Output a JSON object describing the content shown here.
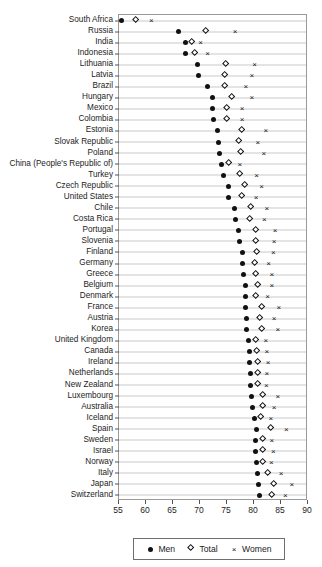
{
  "chart_data": {
    "type": "scatter",
    "title": "",
    "xlabel": "",
    "ylabel": "",
    "xlim": [
      55,
      90
    ],
    "xticks": [
      55,
      60,
      65,
      70,
      75,
      80,
      85,
      90
    ],
    "xticklabels": [
      "55",
      "60",
      "65",
      "70",
      "75",
      "80",
      "85",
      "90"
    ],
    "grid": "horizontal",
    "legend_position": "bottom",
    "series": [
      {
        "name": "Men",
        "marker": "filled-circle"
      },
      {
        "name": "Total",
        "marker": "open-diamond"
      },
      {
        "name": "Women",
        "marker": "cross"
      }
    ],
    "categories": [
      "South Africa",
      "Russia",
      "India",
      "Indonesia",
      "Lithuania",
      "Latvia",
      "Brazil",
      "Hungary",
      "Mexico",
      "Colombia",
      "Estonia",
      "Slovak Republic",
      "Poland",
      "China (People's Republic of)",
      "Turkey",
      "Czech Republic",
      "United States",
      "Chile",
      "Costa Rica",
      "Portugal",
      "Slovenia",
      "Finland",
      "Germany",
      "Greece",
      "Belgium",
      "Denmark",
      "France",
      "Austria",
      "Korea",
      "United Kingdom",
      "Canada",
      "Ireland",
      "Netherlands",
      "New Zealand",
      "Luxembourg",
      "Australia",
      "Iceland",
      "Spain",
      "Sweden",
      "Israel",
      "Norway",
      "Italy",
      "Japan",
      "Switzerland"
    ],
    "rows": [
      {
        "category": "South Africa",
        "men": 55.5,
        "total": 58.3,
        "women": 61.0
      },
      {
        "category": "Russia",
        "men": 66.0,
        "total": 71.2,
        "women": 76.5
      },
      {
        "category": "India",
        "men": 67.4,
        "total": 68.6,
        "women": 70.1
      },
      {
        "category": "Indonesia",
        "men": 67.3,
        "total": 69.2,
        "women": 71.4
      },
      {
        "category": "Lithuania",
        "men": 69.5,
        "total": 74.9,
        "women": 80.1
      },
      {
        "category": "Latvia",
        "men": 69.8,
        "total": 74.8,
        "women": 79.6
      },
      {
        "category": "Brazil",
        "men": 71.4,
        "total": 74.8,
        "women": 78.5
      },
      {
        "category": "Hungary",
        "men": 72.3,
        "total": 76.0,
        "women": 79.6
      },
      {
        "category": "Mexico",
        "men": 72.4,
        "total": 75.1,
        "women": 77.8
      },
      {
        "category": "Colombia",
        "men": 72.5,
        "total": 75.2,
        "women": 77.8
      },
      {
        "category": "Estonia",
        "men": 73.3,
        "total": 78.0,
        "women": 82.2
      },
      {
        "category": "Slovak Republic",
        "men": 73.5,
        "total": 77.3,
        "women": 80.7
      },
      {
        "category": "Poland",
        "men": 73.6,
        "total": 77.8,
        "women": 81.8
      },
      {
        "category": "China (People's Republic of)",
        "men": 74.0,
        "total": 75.6,
        "women": 77.4
      },
      {
        "category": "Turkey",
        "men": 74.4,
        "total": 77.5,
        "women": 80.5
      },
      {
        "category": "Czech Republic",
        "men": 75.2,
        "total": 78.4,
        "women": 81.4
      },
      {
        "category": "United States",
        "men": 75.3,
        "total": 77.9,
        "women": 80.4
      },
      {
        "category": "Chile",
        "men": 76.4,
        "total": 79.5,
        "women": 82.4
      },
      {
        "category": "Costa Rica",
        "men": 76.5,
        "total": 79.4,
        "women": 81.9
      },
      {
        "category": "Portugal",
        "men": 77.2,
        "total": 80.6,
        "women": 83.9
      },
      {
        "category": "Slovenia",
        "men": 77.3,
        "total": 80.6,
        "women": 83.7
      },
      {
        "category": "Finland",
        "men": 77.8,
        "total": 80.7,
        "women": 83.6
      },
      {
        "category": "Germany",
        "men": 77.8,
        "total": 80.3,
        "women": 82.7
      },
      {
        "category": "Greece",
        "men": 78.1,
        "total": 80.6,
        "women": 83.3
      },
      {
        "category": "Belgium",
        "men": 78.4,
        "total": 80.9,
        "women": 83.3
      },
      {
        "category": "Denmark",
        "men": 78.5,
        "total": 80.5,
        "women": 82.5
      },
      {
        "category": "France",
        "men": 78.5,
        "total": 81.6,
        "women": 84.6
      },
      {
        "category": "Austria",
        "men": 78.6,
        "total": 81.3,
        "women": 83.7
      },
      {
        "category": "Korea",
        "men": 78.7,
        "total": 81.6,
        "women": 84.4
      },
      {
        "category": "United Kingdom",
        "men": 78.9,
        "total": 80.5,
        "women": 82.2
      },
      {
        "category": "Canada",
        "men": 79.2,
        "total": 80.7,
        "women": 82.4
      },
      {
        "category": "Ireland",
        "men": 79.2,
        "total": 80.9,
        "women": 82.6
      },
      {
        "category": "Netherlands",
        "men": 79.4,
        "total": 80.9,
        "women": 82.4
      },
      {
        "category": "New Zealand",
        "men": 79.4,
        "total": 80.8,
        "women": 82.3
      },
      {
        "category": "Luxembourg",
        "men": 79.5,
        "total": 81.9,
        "women": 84.4
      },
      {
        "category": "Australia",
        "men": 79.8,
        "total": 81.8,
        "women": 83.7
      },
      {
        "category": "Iceland",
        "men": 80.0,
        "total": 81.5,
        "women": 83.1
      },
      {
        "category": "Spain",
        "men": 80.5,
        "total": 83.3,
        "women": 86.0
      },
      {
        "category": "Sweden",
        "men": 80.2,
        "total": 81.8,
        "women": 83.3
      },
      {
        "category": "Israel",
        "men": 80.3,
        "total": 81.9,
        "women": 83.6
      },
      {
        "category": "Norway",
        "men": 80.4,
        "total": 81.8,
        "women": 83.2
      },
      {
        "category": "Italy",
        "men": 80.6,
        "total": 82.8,
        "women": 85.0
      },
      {
        "category": "Japan",
        "men": 80.8,
        "total": 83.9,
        "women": 87.0
      },
      {
        "category": "Switzerland",
        "men": 81.0,
        "total": 83.5,
        "women": 85.8
      }
    ]
  },
  "legend": {
    "items": [
      {
        "label": "Men",
        "marker": "filled-circle"
      },
      {
        "label": "Total",
        "marker": "open-diamond"
      },
      {
        "label": "Women",
        "marker": "cross"
      }
    ]
  },
  "colors": {
    "marker": "#111111",
    "gridline": "#c9c9c9",
    "frame": "#9a9a9a",
    "text": "#1c1c1c"
  }
}
